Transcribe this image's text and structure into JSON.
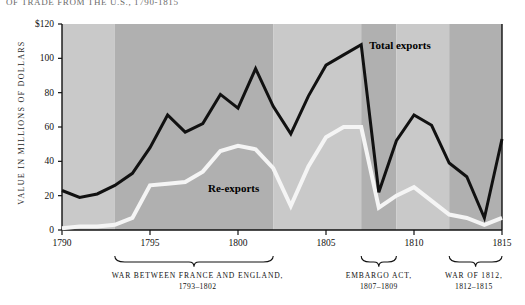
{
  "title": "OF TRADE FROM THE U.S., 1790-1815",
  "axes": {
    "ylabel": "VALUE IN MILLIONS OF DOLLARS",
    "yticks": [
      "$120",
      "100",
      "80",
      "60",
      "40",
      "20",
      "0"
    ],
    "ytick_values": [
      120,
      100,
      80,
      60,
      40,
      20,
      0
    ],
    "xticks": [
      "1790",
      "1795",
      "1800",
      "1805",
      "1810",
      "1815"
    ],
    "xtick_values": [
      1790,
      1795,
      1800,
      1805,
      1810,
      1815
    ]
  },
  "series_labels": {
    "total": "Total exports",
    "reexports": "Re-exports"
  },
  "captions": [
    {
      "name": "war-france-england",
      "line1": "WAR BETWEEN FRANCE AND ENGLAND,",
      "line2": "1793–1802",
      "center_year": 1797.7,
      "span": [
        1793,
        1802
      ]
    },
    {
      "name": "embargo-act",
      "line1": "EMBARGO ACT,",
      "line2": "1807–1809",
      "center_year": 1808.0,
      "span": [
        1807,
        1809
      ]
    },
    {
      "name": "war-of-1812",
      "line1": "WAR OF 1812,",
      "line2": "1812–1815",
      "center_year": 1813.4,
      "span": [
        1812,
        1815
      ]
    }
  ],
  "colors": {
    "band_light": "#c9c9c9",
    "band_dark": "#b0b0b0",
    "total_line": "#111111",
    "reexport_line": "#f5f5f5",
    "axis": "#111111",
    "page_background": "#ffffff"
  },
  "chart_data": {
    "type": "line",
    "title": "OF TRADE FROM THE U.S., 1790-1815",
    "xlabel": "",
    "ylabel": "VALUE IN MILLIONS OF DOLLARS",
    "xlim": [
      1790,
      1815
    ],
    "ylim": [
      0,
      120
    ],
    "grid": false,
    "legend": "inline-annotations",
    "x": [
      1790,
      1791,
      1792,
      1793,
      1794,
      1795,
      1796,
      1797,
      1798,
      1799,
      1800,
      1801,
      1802,
      1803,
      1804,
      1805,
      1806,
      1807,
      1808,
      1809,
      1810,
      1811,
      1812,
      1813,
      1814,
      1815
    ],
    "series": [
      {
        "name": "Total exports",
        "color": "#111111",
        "values": [
          23,
          19,
          21,
          26,
          33,
          48,
          67,
          57,
          62,
          79,
          71,
          94,
          72,
          56,
          78,
          96,
          102,
          108,
          22,
          52,
          67,
          61,
          39,
          31,
          7,
          53
        ]
      },
      {
        "name": "Re-exports",
        "color": "#f5f5f5",
        "values": [
          1,
          2,
          2,
          3,
          7,
          26,
          27,
          28,
          34,
          46,
          49,
          47,
          36,
          14,
          37,
          54,
          60,
          60,
          13,
          20,
          25,
          17,
          9,
          7,
          3,
          7
        ]
      }
    ],
    "background_bands": [
      {
        "from": 1790,
        "to": 1793,
        "shade": "light"
      },
      {
        "from": 1793,
        "to": 1802,
        "shade": "dark"
      },
      {
        "from": 1802,
        "to": 1807,
        "shade": "light"
      },
      {
        "from": 1807,
        "to": 1809,
        "shade": "dark"
      },
      {
        "from": 1809,
        "to": 1812,
        "shade": "light"
      },
      {
        "from": 1812,
        "to": 1815,
        "shade": "dark"
      }
    ]
  }
}
